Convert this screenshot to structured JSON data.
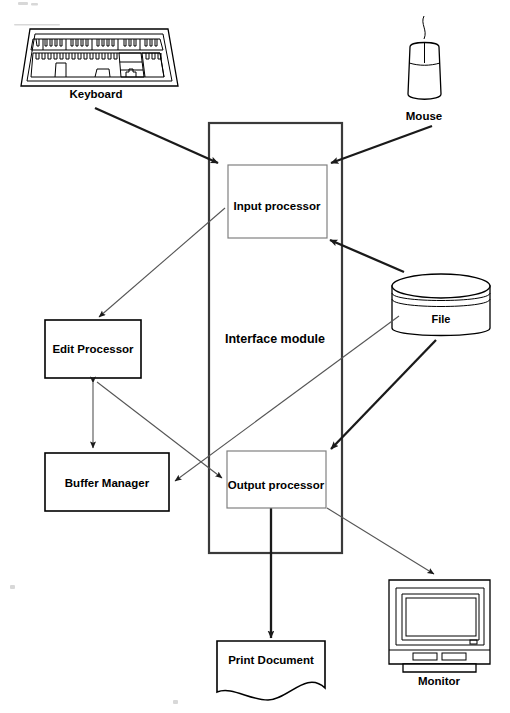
{
  "diagram": {
    "background_color": "#ffffff",
    "line_color": "#000000",
    "thin_line_color": "#555555",
    "inner_box_border_color": "#808080"
  },
  "devices": {
    "keyboard": {
      "label": "Keyboard"
    },
    "mouse": {
      "label": "Mouse"
    },
    "monitor": {
      "label": "Monitor"
    },
    "file": {
      "label": "File"
    },
    "print_document": {
      "label": "Print Document"
    }
  },
  "modules": {
    "interface_module": {
      "label": "Interface module"
    },
    "input_processor": {
      "label": "Input processor"
    },
    "output_processor": {
      "label": "Output processor"
    },
    "edit_processor": {
      "label": "Edit Processor"
    },
    "buffer_manager": {
      "label": "Buffer Manager"
    }
  },
  "connections": [
    {
      "from": "Keyboard",
      "to": "Input processor",
      "style": "thick-arrow"
    },
    {
      "from": "Mouse",
      "to": "Input processor",
      "style": "thick-arrow"
    },
    {
      "from": "File",
      "to": "Input processor",
      "style": "thick-arrow"
    },
    {
      "from": "File",
      "to": "Output processor",
      "style": "thick-arrow"
    },
    {
      "from": "File",
      "to": "Buffer Manager",
      "style": "thin-arrow"
    },
    {
      "from": "Input processor",
      "to": "Edit Processor",
      "style": "thin-arrow"
    },
    {
      "from": "Edit Processor",
      "to": "Buffer Manager",
      "style": "thin-double-arrow"
    },
    {
      "from": "Edit Processor",
      "to": "Output processor",
      "style": "thin-arrow"
    },
    {
      "from": "Output processor",
      "to": "Print Document",
      "style": "thick-arrow"
    },
    {
      "from": "Output processor",
      "to": "Monitor",
      "style": "thin-arrow"
    }
  ]
}
